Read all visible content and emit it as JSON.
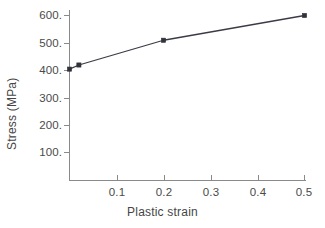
{
  "chart_data": {
    "type": "line",
    "title": "",
    "xlabel": "Plastic strain",
    "ylabel": "Stress (MPa)",
    "x": [
      0.0,
      0.02,
      0.2,
      0.5
    ],
    "values": [
      405,
      420,
      510,
      600
    ],
    "series": [
      {
        "name": "stress-strain",
        "x": [
          0.0,
          0.02,
          0.2,
          0.5
        ],
        "values": [
          405,
          420,
          510,
          600
        ]
      }
    ],
    "xlim": [
      0.0,
      0.5
    ],
    "ylim": [
      0.0,
      640
    ],
    "xticks": [
      0.1,
      0.2,
      0.3,
      0.4,
      0.5
    ],
    "xtick_labels": [
      "0.1",
      "0.2",
      "0.3",
      "0.4",
      "0.5"
    ],
    "yticks": [
      100,
      200,
      300,
      400,
      500,
      600
    ],
    "ytick_labels": [
      "100.",
      "200.",
      "300.",
      "400.",
      "500.",
      "600."
    ],
    "grid": false,
    "legend": "none",
    "markers": "filled-square",
    "line_color": "#3b3b46",
    "marker_color": "#32323c",
    "axis_color": "#8a8a8a",
    "background": "#ffffff"
  },
  "axis": {
    "x_title": "Plastic strain",
    "y_title": "Stress (MPa)",
    "y_labels": [
      "600.",
      "500.",
      "400.",
      "300.",
      "200.",
      "100."
    ],
    "x_labels": [
      "0.1",
      "0.2",
      "0.3",
      "0.4",
      "0.5"
    ]
  }
}
